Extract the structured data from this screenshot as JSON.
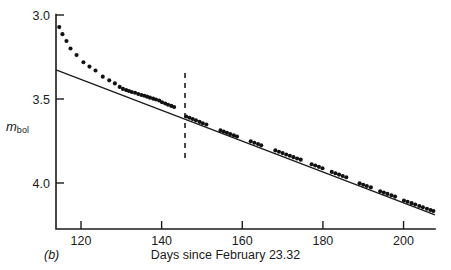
{
  "figure": {
    "panel_label": "(b)",
    "x_axis_title": "Days since February 23.32",
    "y_axis_title_main": "m",
    "y_axis_title_sub": "bol"
  },
  "chart_data": {
    "type": "scatter",
    "title": "",
    "subtitle": "",
    "xlabel": "Days since February 23.32",
    "ylabel": "m_bol",
    "xlim": [
      113.8,
      207.8
    ],
    "ylim": [
      4.33,
      3.0
    ],
    "y_inverted": true,
    "grid": false,
    "legend": null,
    "xticks": [
      120,
      140,
      160,
      180,
      200
    ],
    "xtick_labels": [
      "120",
      "140",
      "160",
      "180",
      "200"
    ],
    "yticks": [
      3.0,
      3.5,
      4.0
    ],
    "ytick_labels": [
      "3.0",
      "3.5",
      "4.0"
    ],
    "series": [
      {
        "name": "bolometric magnitude",
        "marker": "filled-circle",
        "marker_size_px": 3.0,
        "x": [
          114.6,
          115.4,
          116.4,
          117.4,
          118.9,
          120.6,
          122.1,
          123.6,
          125.4,
          127.0,
          128.4,
          129.6,
          130.4,
          131.2,
          131.9,
          132.6,
          133.4,
          134.2,
          135.0,
          135.7,
          136.4,
          137.1,
          137.9,
          138.6,
          139.4,
          140.1,
          140.9,
          141.6,
          142.4,
          143.1,
          146.1,
          146.9,
          147.7,
          148.5,
          149.4,
          150.2,
          151.1,
          154.6,
          155.4,
          156.2,
          157.0,
          157.9,
          158.7,
          162.1,
          163.0,
          163.9,
          164.7,
          168.2,
          169.1,
          170.0,
          170.9,
          171.8,
          172.7,
          173.6,
          174.5,
          177.2,
          178.1,
          179.0,
          179.9,
          182.2,
          183.1,
          184.0,
          184.9,
          185.8,
          189.1,
          190.0,
          190.9,
          191.9,
          194.2,
          195.1,
          196.0,
          197.0,
          197.9,
          200.1,
          201.0,
          202.0,
          202.9,
          203.9,
          204.8,
          205.8,
          206.7,
          207.4
        ],
        "y": [
          3.072,
          3.114,
          3.155,
          3.199,
          3.238,
          3.281,
          3.307,
          3.33,
          3.367,
          3.389,
          3.407,
          3.428,
          3.44,
          3.447,
          3.452,
          3.458,
          3.463,
          3.47,
          3.476,
          3.481,
          3.486,
          3.492,
          3.498,
          3.503,
          3.509,
          3.519,
          3.527,
          3.534,
          3.541,
          3.548,
          3.604,
          3.612,
          3.619,
          3.627,
          3.636,
          3.644,
          3.652,
          3.687,
          3.694,
          3.701,
          3.709,
          3.716,
          3.723,
          3.752,
          3.76,
          3.768,
          3.776,
          3.806,
          3.814,
          3.822,
          3.83,
          3.838,
          3.846,
          3.854,
          3.861,
          3.888,
          3.896,
          3.904,
          3.912,
          3.934,
          3.942,
          3.95,
          3.958,
          3.966,
          4.002,
          4.01,
          4.018,
          4.026,
          4.049,
          4.057,
          4.065,
          4.073,
          4.081,
          4.104,
          4.112,
          4.12,
          4.128,
          4.137,
          4.145,
          4.153,
          4.161,
          4.167
        ]
      }
    ],
    "fit_line": {
      "name": "linear decline fit",
      "x": [
        113.8,
        207.8
      ],
      "y": [
        3.327,
        4.19
      ],
      "slope_mag_per_day": 0.0092,
      "style": "solid"
    },
    "annotations": [
      {
        "type": "vertical-dashed-line",
        "name": "epoch-marker",
        "x": 145.8,
        "y_from": 3.345,
        "y_to": 3.851,
        "style": "dashed"
      }
    ]
  },
  "colors": {
    "ink": "#1b1b1b",
    "marker": "#111111",
    "background": "#ffffff"
  }
}
